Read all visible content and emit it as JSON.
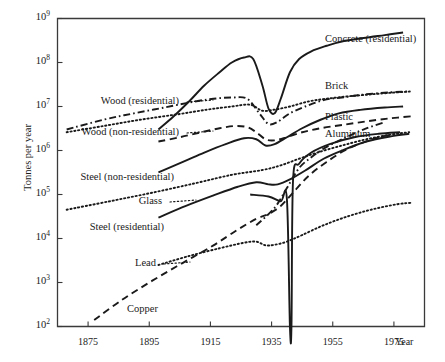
{
  "chart_data": {
    "type": "line",
    "title": "",
    "xlabel": "Year",
    "ylabel": "Tonnes per year",
    "xlim": [
      1865,
      1985
    ],
    "ylim": [
      100,
      1000000000
    ],
    "yscale": "log",
    "grid": false,
    "legend_position": "inline-labels",
    "xticks": [
      1875,
      1895,
      1915,
      1935,
      1955,
      1975
    ],
    "xtick_labels": [
      "1875",
      "1895",
      "1915",
      "1935",
      "1955",
      "1975"
    ],
    "yticks": [
      100,
      1000,
      10000,
      100000,
      1000000,
      10000000,
      100000000,
      1000000000
    ],
    "ytick_labels": [
      "10",
      "10",
      "10",
      "10",
      "10",
      "10",
      "10",
      "10"
    ],
    "ytick_exponents": [
      "2",
      "3",
      "4",
      "5",
      "6",
      "7",
      "8",
      "9"
    ],
    "series": [
      {
        "name": "Concrete (residential)",
        "style": "solid",
        "x": [
          1898,
          1903,
          1908,
          1913,
          1918,
          1922,
          1926,
          1929,
          1932,
          1934,
          1936,
          1938,
          1941,
          1944,
          1948,
          1953,
          1958,
          1965,
          1972,
          1978
        ],
        "values": [
          3000000.0,
          6000000.0,
          13000000.0,
          30000000.0,
          60000000.0,
          100000000.0,
          130000000.0,
          120000000.0,
          30000000.0,
          9000000.0,
          7000000.0,
          15000000.0,
          60000000.0,
          120000000.0,
          180000000.0,
          240000000.0,
          300000000.0,
          360000000.0,
          420000000.0,
          480000000.0
        ]
      },
      {
        "name": "Brick",
        "style": "dash-dot",
        "x": [
          1868,
          1880,
          1890,
          1900,
          1910,
          1916,
          1922,
          1927,
          1931,
          1934,
          1937,
          1941,
          1946,
          1952,
          1958,
          1966,
          1974,
          1980
        ],
        "values": [
          3000000.0,
          5000000.0,
          7000000.0,
          9500000.0,
          13000000.0,
          15000000.0,
          16000000.0,
          15000000.0,
          7000000.0,
          4000000.0,
          4500000.0,
          7000000.0,
          10000000.0,
          14000000.0,
          16000000.0,
          19000000.0,
          21000000.0,
          22000000.0
        ]
      },
      {
        "name": "Wood (residential)",
        "style": "dotted",
        "x": [
          1868,
          1880,
          1892,
          1904,
          1914,
          1922,
          1928,
          1932,
          1936,
          1941,
          1947,
          1953,
          1960,
          1968,
          1976,
          1981
        ],
        "values": [
          2600000.0,
          3600000.0,
          5000000.0,
          6600000.0,
          8500000.0,
          10000000.0,
          11000000.0,
          8000000.0,
          8500000.0,
          10000000.0,
          13000000.0,
          15000000.0,
          17000000.0,
          19000000.0,
          21000000.0,
          22000000.0
        ]
      },
      {
        "name": "Wood (non-residential)",
        "style": "dashed",
        "x": [
          1898,
          1905,
          1912,
          1918,
          1923,
          1927,
          1930,
          1933,
          1936,
          1940,
          1945,
          1951,
          1958,
          1966,
          1974,
          1981
        ],
        "values": [
          1600000.0,
          2000000.0,
          2600000.0,
          3200000.0,
          3600000.0,
          3400000.0,
          2600000.0,
          1800000.0,
          1700000.0,
          2000000.0,
          2600000.0,
          3200000.0,
          3800000.0,
          4600000.0,
          5400000.0,
          6000000.0
        ]
      },
      {
        "name": "Plastic",
        "style": "solid",
        "x": [
          1898,
          1906,
          1913,
          1920,
          1926,
          1930,
          1933,
          1936,
          1940,
          1945,
          1951,
          1957,
          1964,
          1972,
          1978
        ],
        "values": [
          320000.0,
          550000.0,
          900000.0,
          1400000.0,
          1900000.0,
          1800000.0,
          1300000.0,
          1400000.0,
          2000000.0,
          3200000.0,
          5000000.0,
          7000000.0,
          8400000.0,
          9500000.0,
          10000000.0
        ]
      },
      {
        "name": "Aluminum",
        "style": "dash-dot",
        "x": [
          1930,
          1936,
          1940,
          1944,
          1948,
          1952,
          1958,
          1965,
          1972
        ],
        "values": [
          20000.0,
          50000.0,
          140000.0,
          400000.0,
          700000.0,
          1100000.0,
          1800000.0,
          3000000.0,
          4400000.0
        ]
      },
      {
        "name": "Steel (non-residential)",
        "style": "dotted",
        "x": [
          1868,
          1882,
          1896,
          1910,
          1922,
          1932,
          1938,
          1944,
          1950,
          1958,
          1966,
          1974,
          1980
        ],
        "values": [
          45000.0,
          70000.0,
          110000.0,
          180000.0,
          280000.0,
          360000.0,
          460000.0,
          650000.0,
          900000.0,
          1300000.0,
          1800000.0,
          2300000.0,
          2600000.0
        ]
      },
      {
        "name": "Glass",
        "style": "solid",
        "x": [
          1898,
          1907,
          1916,
          1924,
          1930,
          1934,
          1937,
          1941,
          1946,
          1952,
          1958,
          1966,
          1974,
          1980
        ],
        "values": [
          30000.0,
          55000.0,
          95000.0,
          150000.0,
          190000.0,
          170000.0,
          170000.0,
          220000.0,
          350000.0,
          650000.0,
          1000000.0,
          1600000.0,
          2100000.0,
          2400000.0
        ]
      },
      {
        "name": "Steel (residential)",
        "style": "dotted",
        "x": [
          1898,
          1908,
          1918,
          1926,
          1930,
          1933,
          1936,
          1940,
          1945,
          1952,
          1960,
          1968,
          1976,
          1981
        ],
        "values": [
          2500.0,
          4000.0,
          6000.0,
          8000.0,
          8500.0,
          7000.0,
          7200.0,
          8500.0,
          12000.0,
          20000.0,
          32000.0,
          46000.0,
          60000.0,
          65000.0
        ]
      },
      {
        "name": "Lead",
        "style": "solid-spike",
        "x": [
          1928,
          1934,
          1938,
          1940,
          1941,
          1941.5,
          1942,
          1944,
          1948,
          1954,
          1962,
          1970,
          1977
        ],
        "values": [
          100000.0,
          90000.0,
          70000.0,
          80000.0,
          100.0,
          100.0,
          200000.0,
          500000.0,
          900000.0,
          1400000.0,
          2000000.0,
          2400000.0,
          2600000.0
        ]
      },
      {
        "name": "Copper",
        "style": "dashed",
        "x": [
          1877,
          1886,
          1896,
          1906,
          1916,
          1924,
          1930,
          1934,
          1938,
          1942,
          1947,
          1953,
          1960,
          1968,
          1974
        ],
        "values": [
          140.0,
          400.0,
          1100.0,
          2800.0,
          7000.0,
          16000.0,
          28000.0,
          36000.0,
          55000.0,
          110000.0,
          260000.0,
          550000.0,
          1100000.0,
          1800000.0,
          2300000.0
        ]
      }
    ],
    "annotations": [
      {
        "label": "Concrete (residential)",
        "x_px": 325,
        "y_px": 40,
        "align": "right",
        "leader": false
      },
      {
        "label": "Brick",
        "x_px": 325,
        "y_px": 87,
        "align": "right",
        "leader": false
      },
      {
        "label": "Plastic",
        "x_px": 325,
        "y_px": 118,
        "align": "right",
        "leader": false
      },
      {
        "label": "Aluminum",
        "x_px": 325,
        "y_px": 135,
        "align": "right",
        "leader": false
      },
      {
        "label": "Wood (residential)",
        "x_px": 183,
        "y_px": 102,
        "align": "leftal",
        "leader": true
      },
      {
        "label": "Wood (non-residential)",
        "x_px": 183,
        "y_px": 133,
        "align": "leftal",
        "leader": true
      },
      {
        "label": "Steel (non-residential)",
        "x_px": 178,
        "y_px": 178,
        "align": "leftal",
        "leader": false
      },
      {
        "label": "Glass",
        "x_px": 166,
        "y_px": 202,
        "align": "leftal",
        "leader": true
      },
      {
        "label": "Steel (residential)",
        "x_px": 168,
        "y_px": 228,
        "align": "leftal",
        "leader": false
      },
      {
        "label": "Lead",
        "x_px": 160,
        "y_px": 264,
        "align": "leftal",
        "leader": true
      },
      {
        "label": "Copper",
        "x_px": 162,
        "y_px": 310,
        "align": "leftal",
        "leader": false
      }
    ]
  },
  "colors": {
    "ink": "#1a1a1a",
    "axis": "#3a3a3a",
    "background": "#ffffff"
  }
}
